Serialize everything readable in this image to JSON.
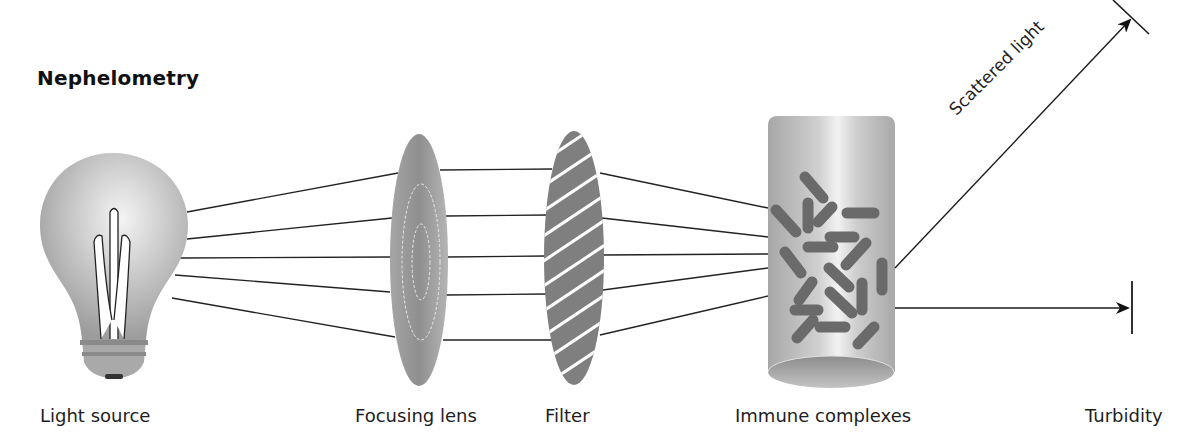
{
  "title": "Nephelometry",
  "components": [
    {
      "id": "light-source",
      "label": "Light source"
    },
    {
      "id": "focusing-lens",
      "label": "Focusing lens"
    },
    {
      "id": "filter",
      "label": "Filter"
    },
    {
      "id": "immune-complexes",
      "label": "Immune complexes"
    },
    {
      "id": "turbidity",
      "label": "Turbidity"
    }
  ],
  "annotations": {
    "scattered_light": "Scattered light"
  },
  "colors": {
    "ink": "#1a1a1a",
    "bulb_gray": "#a8a8a8",
    "lens_gray": "#9a9a9a",
    "filter_gray": "#7d7d7d",
    "cylinder_gray": "#b0b0b0",
    "complex_gray": "#6e6e6e"
  }
}
